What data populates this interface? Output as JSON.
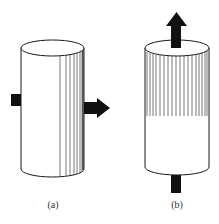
{
  "figure": {
    "panels": [
      {
        "id": "a",
        "label": "(a)",
        "description": "Vertical cylinder with a horizontal arrow passing through it from left to right; vertical hatch lines shading the right side of the cylinder surface",
        "cylinder": {
          "left": 21,
          "right": 84,
          "top": 40,
          "bottom": 177,
          "ellipse_ry": 8
        },
        "arrow": {
          "direction": "right",
          "tail_x": 11,
          "tip_x": 110,
          "y": 108
        },
        "hatch_lines_x": [
          60,
          66,
          70,
          74,
          77,
          80,
          82
        ]
      },
      {
        "id": "b",
        "label": "(b)",
        "description": "Vertical cylinder with a vertical arrow passing through it from bottom to top; upper half of the surface shaded with vertical hatch lines",
        "cylinder": {
          "left": 145,
          "right": 209,
          "top": 40,
          "bottom": 175,
          "ellipse_ry": 8
        },
        "arrow": {
          "direction": "up",
          "tail_y": 193,
          "tip_y": 12,
          "x": 176
        },
        "hatch_region": {
          "top": 48,
          "bottom": 116
        }
      }
    ],
    "colors": {
      "stroke": "#1a1a1a",
      "arrow_fill": "#111111",
      "hatch": "#555555",
      "background": "#ffffff"
    }
  }
}
